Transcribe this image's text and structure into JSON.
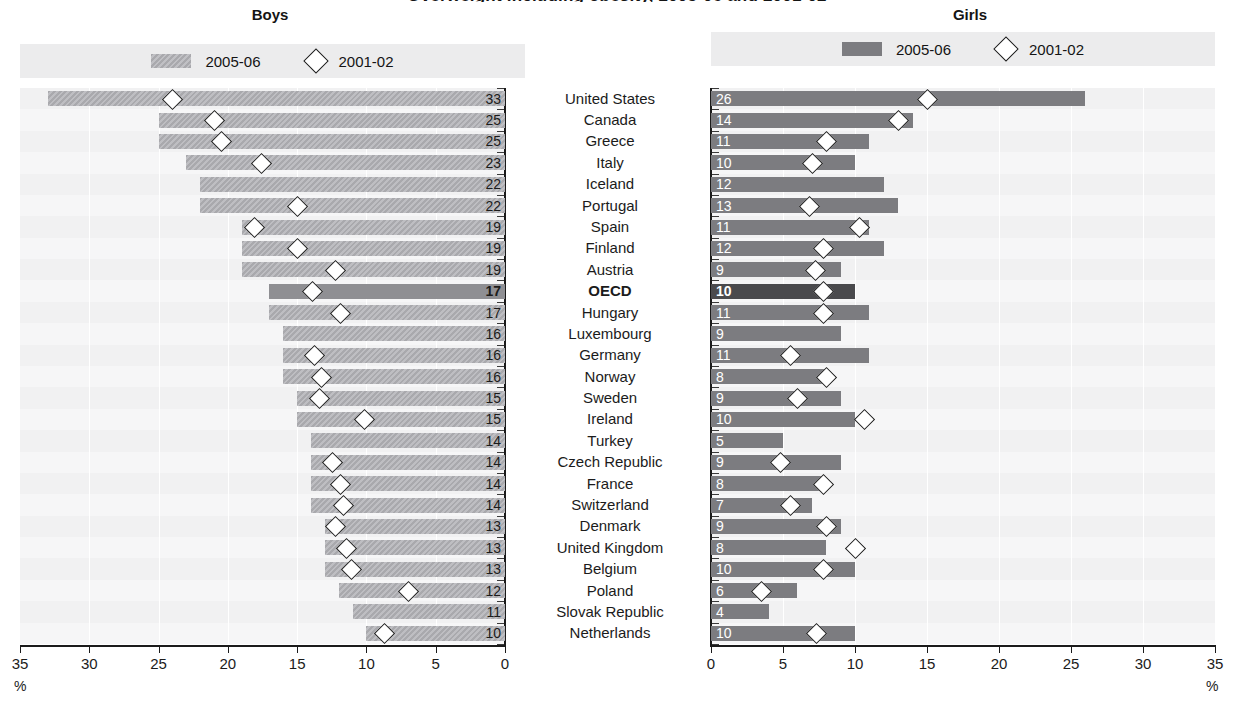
{
  "figure": {
    "title": "Overweight including obesity, 2005-06 and 2001-02",
    "unit_label": "%"
  },
  "panels": {
    "boys": {
      "heading": "Boys",
      "axis": {
        "ticks": [
          "35",
          "30",
          "25",
          "20",
          "15",
          "10",
          "5",
          "0"
        ],
        "min": 0,
        "max": 35,
        "unit": "%",
        "reversed": true
      },
      "legend": {
        "bar_label": "2005-06",
        "marker_label": "2001-02",
        "bar_icon": "hatched-bar-swatch",
        "marker_icon": "diamond-marker"
      }
    },
    "girls": {
      "heading": "Girls",
      "axis": {
        "ticks": [
          "0",
          "5",
          "10",
          "15",
          "20",
          "25",
          "30",
          "35"
        ],
        "min": 0,
        "max": 35,
        "unit": "%",
        "reversed": false
      },
      "legend": {
        "bar_label": "2005-06",
        "marker_label": "2001-02",
        "bar_icon": "solid-bar-swatch",
        "marker_icon": "diamond-marker"
      }
    }
  },
  "colors": {
    "boys_bar": "#b4b4b8",
    "girls_bar": "#7c7c80",
    "highlight_bar": "#4a4a4d",
    "plot_background": "#f1f1f2",
    "legend_background": "#ececed",
    "axis": "#1b1b1b"
  },
  "chart_data": {
    "type": "bar",
    "title": "Overweight including obesity, 2005-06 and 2001-02",
    "xlabel": "%",
    "ylabel": "",
    "xlim": [
      0,
      35
    ],
    "grid": true,
    "legend_position": "top",
    "categories": [
      "United States",
      "Canada",
      "Greece",
      "Italy",
      "Iceland",
      "Portugal",
      "Spain",
      "Finland",
      "Austria",
      "OECD",
      "Hungary",
      "Luxembourg",
      "Germany",
      "Norway",
      "Sweden",
      "Ireland",
      "Turkey",
      "Czech Republic",
      "France",
      "Switzerland",
      "Denmark",
      "United Kingdom",
      "Belgium",
      "Poland",
      "Slovak Republic",
      "Netherlands"
    ],
    "highlight_category": "OECD",
    "panels": [
      {
        "name": "Boys",
        "series": [
          {
            "name": "2005-06",
            "render": "bar",
            "values": [
              33,
              25,
              25,
              23,
              22,
              22,
              19,
              19,
              19,
              17,
              17,
              16,
              16,
              16,
              15,
              15,
              14,
              14,
              14,
              14,
              13,
              13,
              13,
              12,
              11,
              10
            ]
          },
          {
            "name": "2001-02",
            "render": "diamond",
            "values": [
              24.0,
              21.0,
              20.5,
              17.6,
              null,
              15.0,
              18.1,
              15.0,
              12.3,
              13.9,
              11.9,
              null,
              13.8,
              13.3,
              13.4,
              10.2,
              null,
              12.5,
              11.9,
              11.7,
              12.3,
              11.5,
              11.1,
              7.0,
              null,
              8.7
            ]
          }
        ]
      },
      {
        "name": "Girls",
        "series": [
          {
            "name": "2005-06",
            "render": "bar",
            "values": [
              26,
              14,
              11,
              10,
              12,
              13,
              11,
              12,
              9,
              10,
              11,
              9,
              11,
              8,
              9,
              10,
              5,
              9,
              8,
              7,
              9,
              8,
              10,
              6,
              4,
              10
            ]
          },
          {
            "name": "2001-02",
            "render": "diamond",
            "values": [
              15.0,
              13.0,
              8.0,
              7.0,
              null,
              6.8,
              10.3,
              7.8,
              7.2,
              7.8,
              7.8,
              null,
              5.5,
              8.0,
              6.0,
              10.6,
              null,
              4.8,
              7.8,
              5.5,
              8.0,
              10.0,
              7.8,
              3.5,
              null,
              7.3
            ]
          }
        ]
      }
    ]
  }
}
